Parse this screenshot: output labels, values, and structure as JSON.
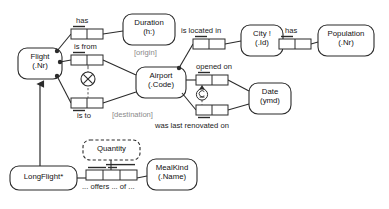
{
  "diagram": {
    "type": "orm-object-role-model",
    "entities": [
      {
        "id": "flight",
        "name": "Flight",
        "ref": "(.Nr)",
        "x": 18,
        "y": 48,
        "w": 44,
        "h": 31,
        "shape": "rounded-solid"
      },
      {
        "id": "duration",
        "name": "Duration",
        "ref": "(h:)",
        "x": 123,
        "y": 14,
        "w": 52,
        "h": 31,
        "shape": "rounded-solid"
      },
      {
        "id": "airport",
        "name": "Airport",
        "ref": "(.Code)",
        "x": 136,
        "y": 67,
        "w": 50,
        "h": 31,
        "shape": "rounded-solid"
      },
      {
        "id": "city",
        "name": "City !",
        "ref": "(.Id)",
        "x": 241,
        "y": 25,
        "w": 42,
        "h": 31,
        "shape": "rounded-solid"
      },
      {
        "id": "population",
        "name": "Population",
        "ref": "(.Nr)",
        "x": 318,
        "y": 25,
        "w": 56,
        "h": 31,
        "shape": "rounded-solid"
      },
      {
        "id": "date",
        "name": "Date",
        "ref": "(ymd)",
        "x": 249,
        "y": 83,
        "w": 42,
        "h": 31,
        "shape": "rounded-solid"
      },
      {
        "id": "longflight",
        "name": "LongFlight*",
        "ref": "",
        "x": 10,
        "y": 166,
        "w": 67,
        "h": 24,
        "shape": "rounded-solid"
      },
      {
        "id": "mealkind",
        "name": "MealKind",
        "ref": "(.Name)",
        "x": 147,
        "y": 159,
        "w": 50,
        "h": 31,
        "shape": "rounded-solid"
      },
      {
        "id": "quantity",
        "name": "Quantity",
        "ref": "",
        "x": 83,
        "y": 140,
        "w": 57,
        "h": 20,
        "shape": "rounded-dashed"
      }
    ],
    "fact_types": [
      {
        "id": "has-duration",
        "predicate": "has",
        "label_pos": "above",
        "roles": 2,
        "x": 71,
        "y": 29,
        "cell_w": 16,
        "h": 10,
        "uniqueness": "first-role"
      },
      {
        "id": "is-from",
        "predicate": "is from",
        "label_pos": "above",
        "roles": 2,
        "x": 71,
        "y": 55,
        "cell_w": 16,
        "h": 10,
        "uniqueness": "first-role"
      },
      {
        "id": "is-to",
        "predicate": "is to",
        "label_pos": "below",
        "roles": 2,
        "x": 71,
        "y": 98,
        "cell_w": 16,
        "h": 10,
        "uniqueness": "first-role-below"
      },
      {
        "id": "is-located-in",
        "predicate": "is located in",
        "label_pos": "above",
        "roles": 2,
        "x": 193,
        "y": 39,
        "cell_w": 16,
        "h": 10,
        "uniqueness": "first-role"
      },
      {
        "id": "city-has-pop",
        "predicate": "has",
        "label_pos": "above",
        "roles": 2,
        "x": 279,
        "y": 39,
        "cell_w": 16,
        "h": 10,
        "uniqueness": "first-role"
      },
      {
        "id": "opened-on",
        "predicate": "opened on",
        "label_pos": "above",
        "roles": 2,
        "x": 196,
        "y": 75,
        "cell_w": 16,
        "h": 10,
        "uniqueness": "first-role"
      },
      {
        "id": "renovated-on",
        "predicate": "was last renovated on",
        "label_pos": "below",
        "roles": 2,
        "x": 196,
        "y": 105,
        "cell_w": 16,
        "h": 10,
        "uniqueness": "first-role-below"
      },
      {
        "id": "offers",
        "predicate": "... offers ... of ...",
        "label_pos": "below",
        "roles": 3,
        "x": 86,
        "y": 170,
        "cell_w": 17,
        "h": 10,
        "uniqueness": "spanning-pairs"
      }
    ],
    "role_labels": [
      {
        "text": "[origin]",
        "x": 134,
        "y": 50,
        "style": "grey-bracket"
      },
      {
        "text": "[destination]",
        "x": 119,
        "y": 112,
        "style": "grey-bracket"
      }
    ],
    "constraints": [
      {
        "id": "exclusion-origin-destination",
        "kind": "exclusion",
        "glyph": "⊗",
        "x": 88,
        "y": 72,
        "connects": [
          "is-from",
          "is-to"
        ]
      },
      {
        "id": "subset-opened-renovated",
        "kind": "subset",
        "glyph": "⊆",
        "x": 197,
        "y": 88,
        "connects": [
          "opened-on",
          "renovated-on"
        ]
      }
    ],
    "subtype_links": [
      {
        "from": "longflight",
        "to": "flight",
        "style": "solid-arrow"
      }
    ],
    "predicate_texts": {
      "has_duration": "has",
      "is_from": "is from",
      "is_to": "is to",
      "is_located_in": "is located in",
      "city_has": "has",
      "opened_on": "opened on",
      "renovated_on": "was last renovated on",
      "offers": "... offers ... of ..."
    },
    "entity_texts": {
      "flight_name": "Flight",
      "flight_ref": "(.Nr)",
      "duration_name": "Duration",
      "duration_ref": "(h:)",
      "airport_name": "Airport",
      "airport_ref": "(.Code)",
      "city_name": "City !",
      "city_ref": "(.Id)",
      "population_name": "Population",
      "population_ref": "(.Nr)",
      "date_name": "Date",
      "date_ref": "(ymd)",
      "longflight_name": "LongFlight*",
      "mealkind_name": "MealKind",
      "mealkind_ref": "(.Name)",
      "quantity_name": "Quantity"
    },
    "annotations": {
      "origin": "[origin]",
      "destination": "[destination]"
    },
    "colors": {
      "stroke": "#2b2b2b",
      "background": "#ffffff",
      "text": "#111111",
      "muted_text": "#8a8a8a",
      "dash": "#555555"
    }
  }
}
